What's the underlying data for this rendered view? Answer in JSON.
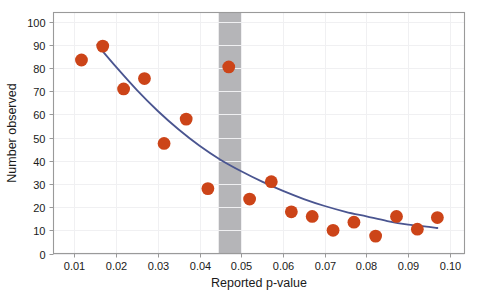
{
  "chart_data": {
    "type": "scatter",
    "title": "",
    "subtitle": "",
    "xlabel": "Reported p-value",
    "ylabel": "Number observed",
    "xlim": [
      0.005,
      0.1035
    ],
    "ylim": [
      0,
      104
    ],
    "xticks": [
      0.01,
      0.02,
      0.03,
      0.04,
      0.05,
      0.06,
      0.07,
      0.08,
      0.09,
      0.1
    ],
    "xticklabels": [
      "0.01",
      "0.02",
      "0.03",
      "0.04",
      "0.05",
      "0.06",
      "0.07",
      "0.08",
      "0.09",
      "0.10"
    ],
    "yticks": [
      0,
      10,
      20,
      30,
      40,
      50,
      60,
      70,
      80,
      90,
      100
    ],
    "yticklabels": [
      "0",
      "10",
      "20",
      "30",
      "40",
      "50",
      "60",
      "70",
      "80",
      "90",
      "100"
    ],
    "grid": true,
    "grid_color": "#f0f0f2",
    "legend": null,
    "legend_position": "none",
    "marker_color": "#cc4418",
    "marker_size": 6.4,
    "line_color": "#4a5590",
    "background_color": "#ffffff",
    "border_color": "#9a9a9a",
    "series": [
      {
        "name": "Observed counts",
        "type": "scatter",
        "marker_color": "#cc4418",
        "x": [
          0.0117,
          0.0168,
          0.0218,
          0.0268,
          0.0315,
          0.0368,
          0.042,
          0.047,
          0.052,
          0.0572,
          0.062,
          0.067,
          0.072,
          0.077,
          0.0822,
          0.0872,
          0.0922,
          0.097
        ],
        "y": [
          83.5,
          89.5,
          71.0,
          75.5,
          47.5,
          58.0,
          28.0,
          80.5,
          23.5,
          31.0,
          18.0,
          16.0,
          10.0,
          13.5,
          7.5,
          16.0,
          10.5,
          15.5
        ]
      },
      {
        "name": "Fitted curve",
        "type": "line",
        "line_color": "#4a5590",
        "x": [
          0.0155,
          0.02,
          0.025,
          0.03,
          0.035,
          0.04,
          0.045,
          0.05,
          0.055,
          0.06,
          0.065,
          0.07,
          0.075,
          0.08,
          0.085,
          0.09,
          0.095,
          0.097
        ],
        "y": [
          90.0,
          80.5,
          70.5,
          61.5,
          53.5,
          46.5,
          40.5,
          35.5,
          31.0,
          27.0,
          23.5,
          20.5,
          18.0,
          16.0,
          14.0,
          12.5,
          11.5,
          11.0
        ]
      }
    ],
    "annotations": [
      {
        "name": "significance-band",
        "type": "vertical-band",
        "x_start": 0.0446,
        "x_end": 0.05,
        "color": "#b5b5b8",
        "label": ""
      }
    ]
  }
}
